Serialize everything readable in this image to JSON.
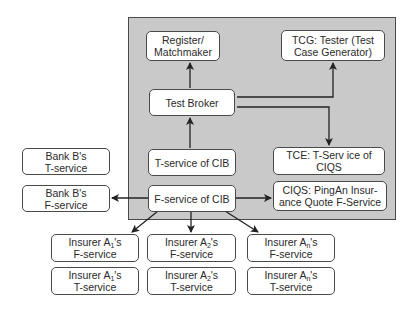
{
  "diagram": {
    "panel_label": "",
    "nodes": {
      "register": {
        "label": "Register/\nMatchmaker"
      },
      "tcg": {
        "label": "TCG: Tester (Test\nCase Generator)"
      },
      "test_broker": {
        "label": "Test Broker"
      },
      "t_service_cib": {
        "label": "T-service of CIB"
      },
      "tce": {
        "label": "TCE: T-Serv ice of\nCIQS"
      },
      "f_service_cib": {
        "label": "F-service of CIB"
      },
      "ciqs": {
        "label": "CIQS: PingAn Insur-\nance Quote F-Service"
      },
      "bank_b_t": {
        "label": "Bank B's\nT-service"
      },
      "bank_b_f": {
        "label": "Bank B's\nF-service"
      },
      "insurer_1_f": {
        "prefix": "Insurer A",
        "sub": "1",
        "suffix": "'s",
        "line2": "F-service"
      },
      "insurer_2_f": {
        "prefix": "Insurer A",
        "sub": "2",
        "suffix": "'s",
        "line2": "F-service"
      },
      "insurer_n_f": {
        "prefix": "Insurer A",
        "sub": "n",
        "suffix": "'s",
        "line2": "F-service"
      },
      "insurer_1_t": {
        "prefix": "Insurer A",
        "sub": "1",
        "suffix": "'s",
        "line2": "T-service"
      },
      "insurer_2_t": {
        "prefix": "Insurer A",
        "sub": "2",
        "suffix": "'s",
        "line2": "T-service"
      },
      "insurer_n_t": {
        "prefix": "Insurer A",
        "sub": "n",
        "suffix": "'s",
        "line2": "T-service"
      }
    },
    "edges": [
      {
        "from": "test_broker",
        "to": "register"
      },
      {
        "from": "test_broker",
        "to": "tcg"
      },
      {
        "from": "test_broker",
        "to": "tce"
      },
      {
        "from": "t_service_cib",
        "to": "test_broker"
      },
      {
        "from": "f_service_cib",
        "to": "bank_b_f"
      },
      {
        "from": "f_service_cib",
        "to": "ciqs"
      },
      {
        "from": "f_service_cib",
        "to": "insurer_1_f"
      },
      {
        "from": "f_service_cib",
        "to": "insurer_2_f"
      },
      {
        "from": "f_service_cib",
        "to": "insurer_n_f"
      }
    ],
    "colors": {
      "panel": "#c9c9c9",
      "stroke": "#4a4a4a",
      "box": "#ffffff",
      "arrow": "#222222"
    }
  }
}
